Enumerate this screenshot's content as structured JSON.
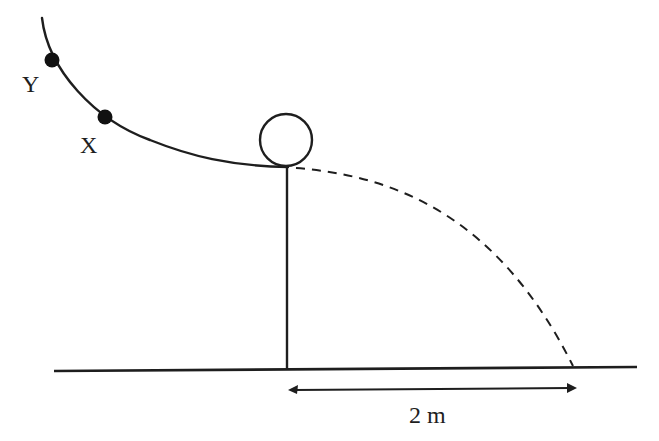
{
  "diagram": {
    "points": [
      {
        "id": "Y",
        "label": "Y"
      },
      {
        "id": "X",
        "label": "X"
      }
    ],
    "distance_label": "2 m",
    "colors": {
      "line": "#1e1e1e",
      "background": "#ffffff"
    }
  }
}
